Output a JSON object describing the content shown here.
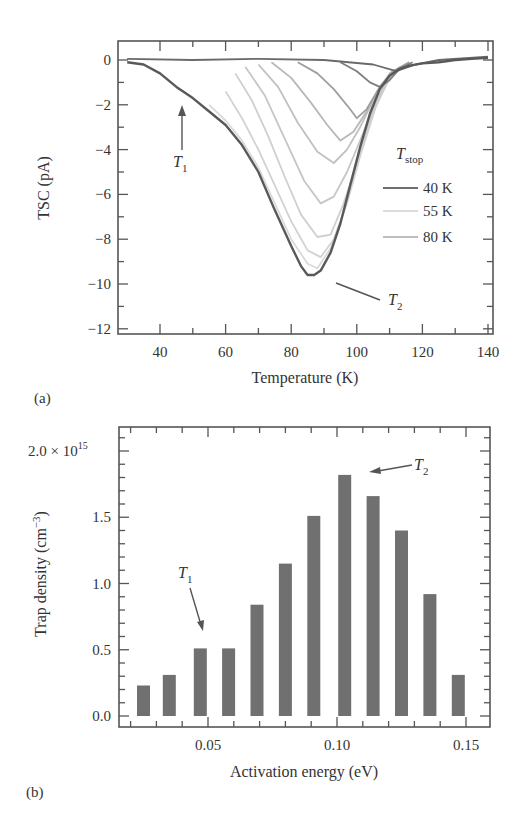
{
  "chart_data": [
    {
      "panel": "(a)",
      "type": "line",
      "xlabel": "Temperature (K)",
      "ylabel": "TSC (pA)",
      "xlim": [
        28,
        142
      ],
      "ylim": [
        -12.2,
        0.9
      ],
      "xticks": [
        40,
        60,
        80,
        100,
        120,
        140
      ],
      "yticks": [
        0,
        -2,
        -4,
        -6,
        -8,
        -10,
        -12
      ],
      "grid": false,
      "legend": {
        "title": "T",
        "title_sub": "stop",
        "position": "right-middle",
        "entries": [
          {
            "label": "40 K",
            "color": "#6e6e6e"
          },
          {
            "label": "55 K",
            "color": "#dcdcdc"
          },
          {
            "label": "80 K",
            "color": "#bdbdbd"
          }
        ]
      },
      "annotations": [
        {
          "text": "T",
          "sub": "1",
          "x": 47,
          "y": -4.3,
          "arrow_to": [
            47,
            -2.0
          ]
        },
        {
          "text": "T",
          "sub": "2",
          "x": 108,
          "y": -11.0,
          "arrow_to": [
            92,
            -10.0
          ]
        }
      ],
      "series": [
        {
          "name": "Tstop 40 K (full curve)",
          "color": "#595959",
          "x": [
            30,
            35,
            40,
            45,
            50,
            55,
            60,
            65,
            70,
            75,
            80,
            83,
            85,
            87,
            89,
            92,
            95,
            98,
            101,
            104,
            107,
            110,
            113,
            116,
            120,
            125,
            130,
            135,
            140
          ],
          "y": [
            -0.1,
            -0.2,
            -0.6,
            -1.2,
            -1.7,
            -2.3,
            -2.9,
            -3.8,
            -5.0,
            -6.7,
            -8.3,
            -9.2,
            -9.6,
            -9.6,
            -9.4,
            -8.6,
            -7.3,
            -5.6,
            -3.9,
            -2.4,
            -1.3,
            -0.7,
            -0.4,
            -0.25,
            -0.15,
            -0.1,
            0.0,
            0.05,
            0.1
          ]
        },
        {
          "name": "Tstop 55 K",
          "color": "#d9d9d9",
          "x": [
            55,
            60,
            65,
            70,
            75,
            80,
            85,
            88,
            92,
            96,
            100,
            105,
            110,
            115
          ],
          "y": [
            -2.0,
            -2.7,
            -3.6,
            -4.8,
            -6.4,
            -8.0,
            -9.1,
            -9.3,
            -8.4,
            -6.8,
            -4.6,
            -2.3,
            -0.8,
            -0.2
          ]
        },
        {
          "name": "Tstop 60 K",
          "color": "#d2d2d2",
          "x": [
            60,
            65,
            70,
            75,
            80,
            85,
            89,
            93,
            97,
            101,
            106,
            110,
            115
          ],
          "y": [
            -1.4,
            -2.6,
            -4.0,
            -5.6,
            -7.2,
            -8.5,
            -8.8,
            -8.0,
            -6.4,
            -4.3,
            -2.0,
            -0.8,
            -0.2
          ]
        },
        {
          "name": "Tstop 65 K",
          "color": "#cfcfcf",
          "x": [
            63,
            68,
            73,
            78,
            83,
            88,
            92,
            96,
            100,
            105,
            110,
            115
          ],
          "y": [
            -0.6,
            -1.8,
            -3.4,
            -5.2,
            -6.9,
            -7.9,
            -7.8,
            -6.4,
            -4.6,
            -2.3,
            -0.8,
            -0.2
          ]
        },
        {
          "name": "Tstop 70 K",
          "color": "#c6c6c6",
          "x": [
            66,
            72,
            78,
            84,
            89,
            93,
            97,
            101,
            106,
            110,
            115
          ],
          "y": [
            -0.3,
            -1.6,
            -3.5,
            -5.4,
            -6.4,
            -6.1,
            -5.0,
            -3.6,
            -1.8,
            -0.7,
            -0.2
          ]
        },
        {
          "name": "Tstop 75 K",
          "color": "#c0c0c0",
          "x": [
            70,
            76,
            82,
            88,
            93,
            97,
            101,
            106,
            110,
            115
          ],
          "y": [
            -0.2,
            -1.2,
            -2.8,
            -4.1,
            -4.6,
            -4.0,
            -3.0,
            -1.5,
            -0.6,
            -0.2
          ]
        },
        {
          "name": "Tstop 80 K",
          "color": "#b8b8b8",
          "x": [
            74,
            80,
            86,
            91,
            95,
            99,
            103,
            107,
            111,
            116
          ],
          "y": [
            -0.1,
            -0.8,
            -1.9,
            -2.9,
            -3.6,
            -3.2,
            -2.3,
            -1.2,
            -0.5,
            -0.1
          ]
        },
        {
          "name": "Tstop 90 K",
          "color": "#9e9e9e",
          "x": [
            82,
            88,
            93,
            98,
            100,
            103,
            107,
            111,
            116
          ],
          "y": [
            -0.1,
            -0.6,
            -1.3,
            -2.2,
            -2.6,
            -2.2,
            -1.2,
            -0.5,
            -0.1
          ]
        },
        {
          "name": "Tstop 100 K",
          "color": "#7e7e7e",
          "x": [
            95,
            100,
            104,
            107,
            110,
            113,
            117
          ],
          "y": [
            -0.1,
            -0.5,
            -1.0,
            -1.2,
            -0.9,
            -0.4,
            -0.1
          ]
        },
        {
          "name": "Tstop high (baseline)",
          "color": "#6a6a6a",
          "x": [
            30,
            50,
            70,
            90,
            105,
            112,
            118,
            125,
            140
          ],
          "y": [
            0.05,
            0.0,
            0.05,
            0.0,
            -0.2,
            -0.5,
            -0.2,
            0.0,
            0.15
          ]
        }
      ]
    },
    {
      "panel": "(b)",
      "type": "bar",
      "xlabel": "Activation energy (eV)",
      "ylabel": "Trap density (cm⁻³)",
      "y_multiplier": "× 10^15",
      "xlim": [
        0.0155,
        0.1595
      ],
      "ylim": [
        -0.08,
        2.18
      ],
      "xticks": [
        0.05,
        0.1,
        0.15
      ],
      "yticks": [
        0.0,
        0.5,
        1.0,
        1.5,
        2.0
      ],
      "grid": false,
      "bar_color": "#707070",
      "x": [
        0.025,
        0.035,
        0.047,
        0.058,
        0.069,
        0.08,
        0.091,
        0.103,
        0.114,
        0.125,
        0.136,
        0.147
      ],
      "values": [
        0.23,
        0.31,
        0.51,
        0.51,
        0.84,
        1.15,
        1.51,
        1.82,
        1.66,
        1.4,
        0.92,
        0.31
      ],
      "annotations": [
        {
          "text": "T",
          "sub": "1",
          "x": 0.045,
          "y": 1.05,
          "arrow_to": [
            0.048,
            0.66
          ]
        },
        {
          "text": "T",
          "sub": "2",
          "x": 0.122,
          "y": 1.87,
          "arrow_to": [
            0.108,
            1.84
          ]
        }
      ]
    }
  ],
  "labels": {
    "a": {
      "panel": "(a)",
      "xlabel": "Temperature (K)",
      "ylabel": "TSC (pA)",
      "xticks": [
        "40",
        "60",
        "80",
        "100",
        "120",
        "140"
      ],
      "yticks": [
        "0",
        "−2",
        "−4",
        "−6",
        "−8",
        "−10",
        "−12"
      ],
      "legend_title": "T",
      "legend_title_sub": "stop",
      "legend": [
        "40 K",
        "55 K",
        "80 K"
      ],
      "t1": "T",
      "t1_sub": "1",
      "t2": "T",
      "t2_sub": "2"
    },
    "b": {
      "panel": "(b)",
      "xlabel": "Activation energy (eV)",
      "ylabel_main": "Trap density (cm",
      "ylabel_exp": "−3",
      "ylabel_end": ")",
      "xticks": [
        "0.05",
        "0.10",
        "0.15"
      ],
      "yticks": [
        "0.0",
        "0.5",
        "1.0",
        "1.5"
      ],
      "ytop_mantissa": "2.0 × 10",
      "ytop_exp": "15",
      "t1": "T",
      "t1_sub": "1",
      "t2": "T",
      "t2_sub": "2"
    }
  }
}
